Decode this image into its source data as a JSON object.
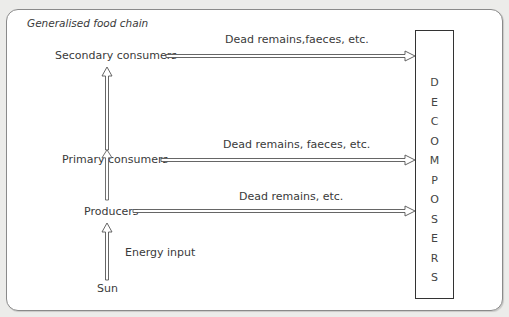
{
  "title": "Generalised food chain",
  "levels": [
    {
      "name": "Secondary consumers",
      "flow_label": "Dead remains,faeces, etc."
    },
    {
      "name": "Primary consumers",
      "flow_label": "Dead remains, faeces, etc."
    },
    {
      "name": "Producers",
      "flow_label": "Dead remains, etc."
    },
    {
      "name": "Sun"
    }
  ],
  "energy_label": "Energy input",
  "decomposers": {
    "label": "DECOMPOSERS",
    "letters": [
      "D",
      "E",
      "C",
      "O",
      "M",
      "P",
      "O",
      "S",
      "E",
      "R",
      "S"
    ]
  },
  "colors": {
    "outline": "#8a8a8a",
    "text": "#3a3a3a",
    "box_border": "#333333"
  }
}
